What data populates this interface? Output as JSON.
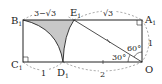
{
  "diagram": {
    "points": {
      "B1": {
        "name": "B",
        "sub": "1"
      },
      "E1": {
        "name": "E",
        "sub": "1"
      },
      "A1": {
        "name": "A",
        "sub": "1"
      },
      "C1": {
        "name": "C",
        "sub": "1"
      },
      "D1": {
        "name": "D",
        "sub": "1"
      },
      "O": {
        "name": "O",
        "sub": ""
      }
    },
    "lengths": {
      "B1E1": "3−√3",
      "E1A1": "√3",
      "A1O": "1",
      "C1D1": "1",
      "D1O": "2"
    },
    "angles": {
      "upper": "60°",
      "lower": "30°"
    },
    "colors": {
      "shade": "#c8c8c8",
      "stroke": "#222222"
    }
  }
}
